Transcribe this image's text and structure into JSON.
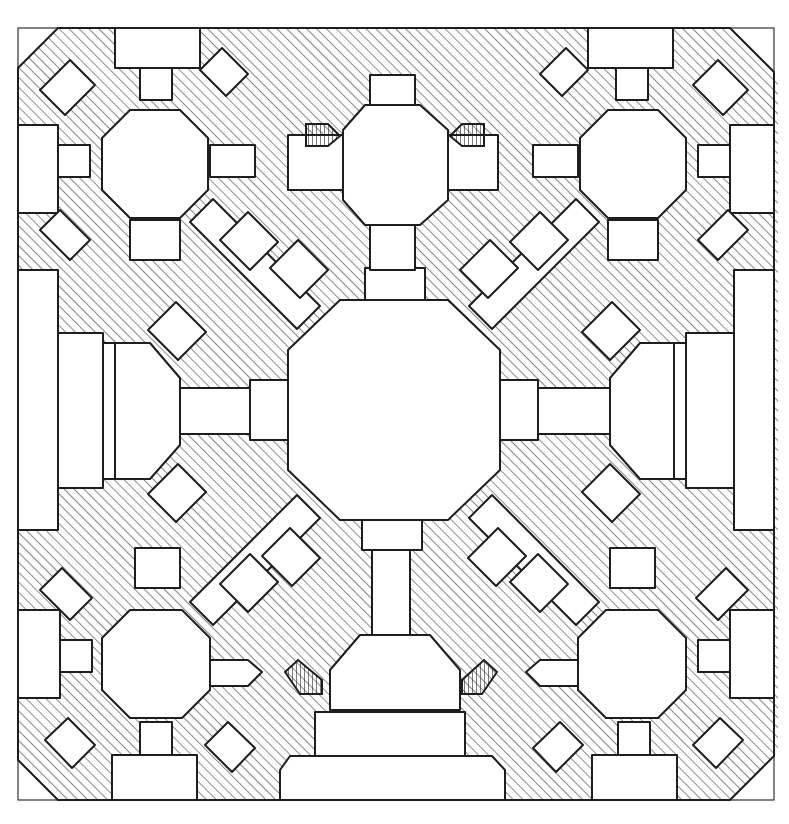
{
  "drawing": {
    "type": "architectural floor plan",
    "style": "hand-drawn ink sketch with diagonal hatching for solid masonry",
    "colors": {
      "ink": "#1e1e1e",
      "paper": "#ffffff",
      "hatch": "#3a3a3a"
    },
    "symmetry": "four-fold (quadrilateral) symmetry about central octagonal hall",
    "elements": {
      "central_hall": "large octagonal domed hall at center",
      "corner_rooms": [
        "top-left octagon",
        "top-right octagon",
        "bottom-left octagon",
        "bottom-right octagon"
      ],
      "top_center_room": "smaller octagonal room at top center with two stair flights",
      "bottom_entrance": "entrance portal with half-octagon vestibule and two stair flights",
      "side_iwans": [
        "left rectangular iwan",
        "right rectangular iwan"
      ],
      "diagonal_corridors": 4,
      "outer_boundary": "square enclosure with chamfered corners"
    }
  }
}
